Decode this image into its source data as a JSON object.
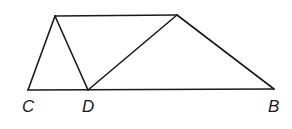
{
  "diagram": {
    "type": "geometry-figure",
    "points": {
      "A": {
        "label": "",
        "x": 55,
        "y": 16
      },
      "E": {
        "label": "",
        "x": 177,
        "y": 15
      },
      "C": {
        "label": "C",
        "x": 28,
        "y": 90
      },
      "D": {
        "label": "D",
        "x": 88,
        "y": 90
      },
      "B": {
        "label": "B",
        "x": 274,
        "y": 89
      }
    },
    "segments": [
      [
        "A",
        "E"
      ],
      [
        "C",
        "B"
      ],
      [
        "A",
        "C"
      ],
      [
        "A",
        "D"
      ],
      [
        "D",
        "E"
      ],
      [
        "E",
        "B"
      ]
    ],
    "labels": {
      "C": "C",
      "D": "D",
      "B": "B"
    },
    "line_color": "#1a1a1a"
  }
}
